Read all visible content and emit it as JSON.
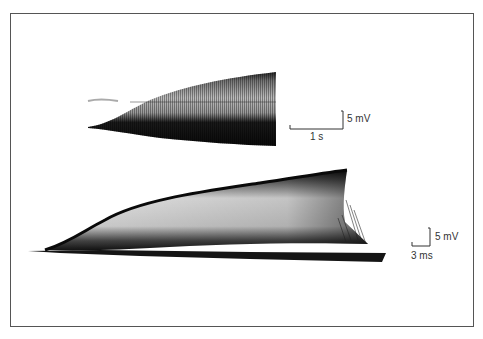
{
  "figure": {
    "panels": [
      {
        "id": "top-trace",
        "scale_bar": {
          "time_label": "1 s",
          "voltage_label": "5 mV"
        }
      },
      {
        "id": "bottom-trace",
        "scale_bar": {
          "time_label": "3 ms",
          "voltage_label": "5 mV"
        }
      }
    ]
  },
  "colors": {
    "trace": "#111111",
    "frame": "#555555",
    "background": "#ffffff"
  }
}
